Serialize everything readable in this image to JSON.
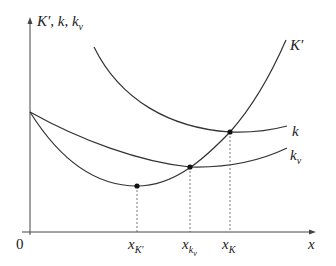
{
  "diagram": {
    "y_axis_label": "K′, k, k",
    "y_axis_label_sub": "v",
    "x_axis_label": "x",
    "origin_label": "0",
    "curves": [
      {
        "name": "K′",
        "label": "K′",
        "description": "U-shaped, minimum at x_K′, rising steeply"
      },
      {
        "name": "k",
        "label": "k",
        "description": "Decreasing then flattening, meets K′ at x_K"
      },
      {
        "name": "k_v",
        "label": "k",
        "label_sub": "v",
        "description": "Flat U-shape, meets K′ at x_kv"
      }
    ],
    "ticks": [
      {
        "label": "x",
        "sub": "K′"
      },
      {
        "label": "x",
        "sub": "k",
        "subsub": "v"
      },
      {
        "label": "x",
        "sub": "K"
      }
    ],
    "colors": {
      "line": "#333333",
      "dash": "#555555"
    }
  }
}
